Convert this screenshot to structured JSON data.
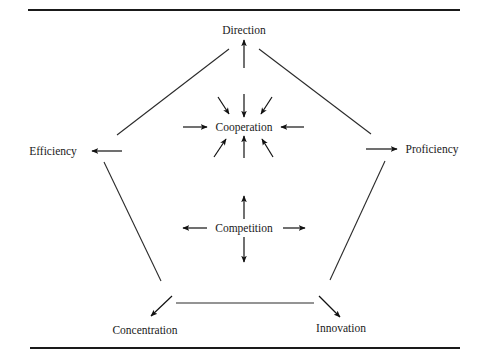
{
  "diagram": {
    "nodes": {
      "direction": "Direction",
      "efficiency": "Efficiency",
      "proficiency": "Proficiency",
      "concentration": "Concentration",
      "innovation": "Innovation",
      "cooperation": "Cooperation",
      "competition": "Competition"
    },
    "structure": {
      "shape": "pentagon",
      "outer_nodes": [
        "Direction",
        "Proficiency",
        "Innovation",
        "Concentration",
        "Efficiency"
      ],
      "center_top": "Cooperation",
      "center_top_arrows": "8 arrows pointing inward",
      "center_bottom": "Competition",
      "center_bottom_arrows": "4 arrows pointing outward",
      "outer_arrows": "each outer node has an arrow pointing outward toward its label"
    },
    "colors": {
      "line": "#2a2a2a",
      "text": "#1a1a1a",
      "background": "#ffffff"
    }
  }
}
